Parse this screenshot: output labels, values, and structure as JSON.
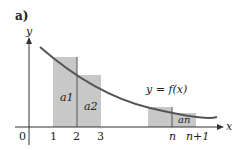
{
  "panel_label": "a)",
  "axes": {
    "x_label": "x",
    "y_label": "y",
    "origin": "0"
  },
  "ticks": [
    "1",
    "2",
    "3",
    "n",
    "n+1"
  ],
  "curve_label": "y = f(x)",
  "areas": [
    "a1",
    "a2",
    "an"
  ],
  "colors": {
    "rect_fill": "#c8c8c8",
    "curve": "#555555",
    "axis": "#333333"
  }
}
